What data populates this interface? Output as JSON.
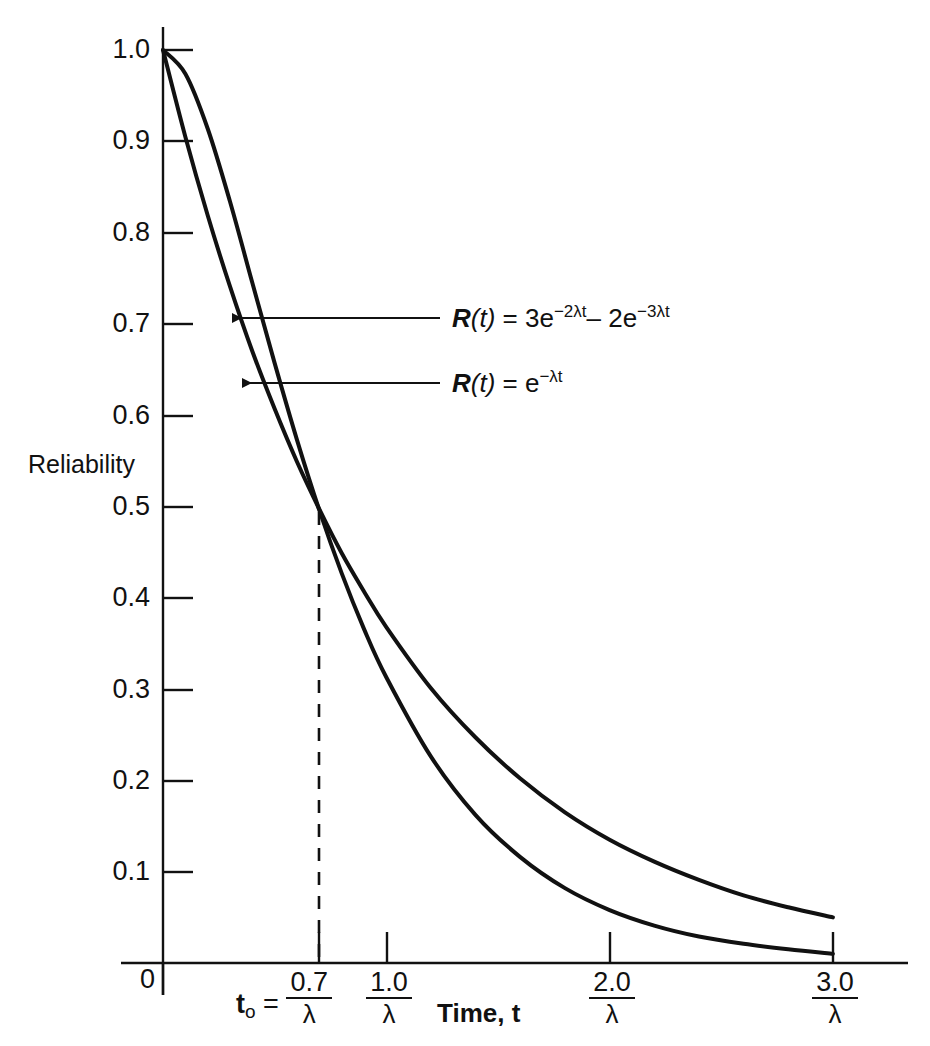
{
  "chart_data": {
    "type": "line",
    "title": "",
    "xlabel": "Time, t",
    "ylabel": "Reliability",
    "xlim": [
      0,
      3.4
    ],
    "ylim": [
      0,
      1.05
    ],
    "grid": false,
    "legend_position": "inline-annotations",
    "x_tick_labels": [
      {
        "value": 0,
        "text": "0",
        "kind": "plain"
      },
      {
        "value": 0.7,
        "numerator": "0.7",
        "denominator": "λ",
        "prefix": "t₀ =",
        "kind": "fraction"
      },
      {
        "value": 1.0,
        "numerator": "1.0",
        "denominator": "λ",
        "kind": "fraction"
      },
      {
        "value": 2.0,
        "numerator": "2.0",
        "denominator": "λ",
        "kind": "fraction"
      },
      {
        "value": 3.0,
        "numerator": "3.0",
        "denominator": "λ",
        "kind": "fraction"
      }
    ],
    "y_tick_labels": [
      "1.0",
      "0.9",
      "0.8",
      "0.7",
      "0.6",
      "0.5",
      "0.4",
      "0.3",
      "0.2",
      "0.1"
    ],
    "y_tick_values": [
      1.0,
      0.9,
      0.8,
      0.7,
      0.6,
      0.5,
      0.4,
      0.3,
      0.2,
      0.1
    ],
    "series": [
      {
        "name": "R (t) = 3e^{-2λt} - 2e^{-3λt}",
        "label_html": "R (t) = 3e<sup>−2λt</sup>– 2e<sup>−3λt</sup>",
        "color": "#111111",
        "x": [
          0,
          0.1,
          0.2,
          0.3,
          0.4,
          0.5,
          0.6,
          0.7,
          0.8,
          0.9,
          1.0,
          1.2,
          1.4,
          1.6,
          1.8,
          2.0,
          2.2,
          2.4,
          2.6,
          2.8,
          3.0
        ],
        "y": [
          1.0,
          0.974,
          0.914,
          0.834,
          0.745,
          0.657,
          0.573,
          0.496,
          0.427,
          0.366,
          0.313,
          0.226,
          0.162,
          0.116,
          0.082,
          0.058,
          0.041,
          0.029,
          0.021,
          0.015,
          0.01
        ]
      },
      {
        "name": "R(t) = e^{-λt}",
        "label_html": "R(t) = e<sup>−λt</sup>",
        "color": "#111111",
        "x": [
          0,
          0.1,
          0.2,
          0.3,
          0.4,
          0.5,
          0.6,
          0.7,
          0.8,
          0.9,
          1.0,
          1.2,
          1.4,
          1.6,
          1.8,
          2.0,
          2.2,
          2.4,
          2.6,
          2.8,
          3.0
        ],
        "y": [
          1.0,
          0.905,
          0.819,
          0.741,
          0.67,
          0.607,
          0.549,
          0.497,
          0.449,
          0.407,
          0.368,
          0.301,
          0.247,
          0.202,
          0.165,
          0.135,
          0.111,
          0.091,
          0.074,
          0.061,
          0.05
        ]
      }
    ],
    "annotations": [
      {
        "name": "upper-curve-equation",
        "text": "R (t) = 3e^-2λt – 2e^-3λt",
        "points_to": {
          "x": 0.32,
          "y": 0.715
        }
      },
      {
        "name": "lower-curve-equation",
        "text": "R(t) = e^-λt",
        "points_to": {
          "x": 0.36,
          "y": 0.635
        }
      },
      {
        "name": "t0-dropline",
        "text": "t₀ = 0.7/λ",
        "from": {
          "x": 0.7,
          "y": 0.5
        },
        "to": {
          "x": 0.7,
          "y": 0.0
        },
        "style": "dashed"
      }
    ]
  },
  "labels": {
    "y_axis_title": "Reliability",
    "x_axis_title": "Time, t",
    "origin": "0",
    "t0_prefix": "t",
    "t0_subscript": "o",
    "t0_equals": "=",
    "lambda": "λ"
  },
  "equations": {
    "upper": {
      "r": "R",
      "arg": "(t)",
      "eq": "= 3e",
      "exp1": "−2λt",
      "mid": "– 2e",
      "exp2": "−3λt"
    },
    "lower": {
      "r": "R",
      "arg": "(t)",
      "eq": "= e",
      "exp1": "−λt"
    }
  },
  "colors": {
    "ink": "#111111",
    "background": "#ffffff"
  }
}
